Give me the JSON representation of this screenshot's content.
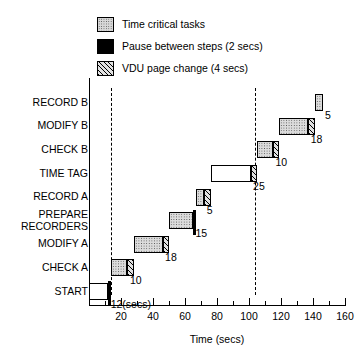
{
  "legend": {
    "items": [
      {
        "label": "Time critical tasks",
        "style": "dots"
      },
      {
        "label": "Pause between steps (2 secs)",
        "style": "black"
      },
      {
        "label": "VDU page change (4 secs)",
        "style": "hatch"
      }
    ]
  },
  "axes": {
    "x_title": "Time (secs)",
    "x_ticks": [
      20,
      40,
      60,
      80,
      100,
      120,
      140,
      160
    ],
    "x_minor_step": 10,
    "x_range": [
      0,
      160
    ],
    "y_categories": [
      "START",
      "CHECK A",
      "MODIFY A",
      "PREPARE RECORDERS",
      "RECORD A",
      "TIME TAG",
      "CHECK B",
      "MODIFY B",
      "RECORD B"
    ],
    "y_labels": [
      {
        "text": "RECORD B",
        "row": 9
      },
      {
        "text": "MODIFY B",
        "row": 8
      },
      {
        "text": "CHECK B",
        "row": 7
      },
      {
        "text": "TIME TAG",
        "row": 6
      },
      {
        "text": "RECORD A",
        "row": 5
      },
      {
        "text": "PREPARE\nRECORDERS",
        "row": 4
      },
      {
        "text": "MODIFY A",
        "row": 3
      },
      {
        "text": "CHECK A",
        "row": 2
      },
      {
        "text": "START",
        "row": 1
      }
    ],
    "reference_lines": [
      14,
      104
    ]
  },
  "chart_data": {
    "type": "bar",
    "title": "",
    "xlabel": "Time (secs)",
    "ylabel": "",
    "xlim": [
      0,
      160
    ],
    "grid": false,
    "legend_position": "top",
    "orientation": "horizontal-staircase",
    "categories": [
      "START",
      "CHECK A",
      "MODIFY A",
      "PREPARE RECORDERS",
      "RECORD A",
      "TIME TAG",
      "CHECK B",
      "MODIFY B",
      "RECORD B"
    ],
    "durations": [
      12,
      10,
      18,
      15,
      5,
      25,
      10,
      18,
      5
    ],
    "value_labels": [
      "12(secs)",
      "10",
      "18",
      "15",
      "5",
      "25",
      "10",
      "18",
      "5"
    ],
    "segments": [
      {
        "task": "START",
        "row": 1,
        "start": 0,
        "end": 12,
        "duration": 12,
        "kind": "plain",
        "label": "12(secs)"
      },
      {
        "task": "PAUSE 1",
        "row": 1,
        "start": 12,
        "end": 14,
        "duration": 2,
        "kind": "pause",
        "label": ""
      },
      {
        "task": "CHECK A",
        "row": 2,
        "start": 14,
        "end": 24,
        "duration": 10,
        "kind": "task",
        "label": "10"
      },
      {
        "task": "VDU 1",
        "row": 2,
        "start": 24,
        "end": 28,
        "duration": 4,
        "kind": "vdu",
        "label": ""
      },
      {
        "task": "MODIFY A",
        "row": 3,
        "start": 28,
        "end": 46,
        "duration": 18,
        "kind": "task",
        "label": "18"
      },
      {
        "task": "VDU 2",
        "row": 3,
        "start": 46,
        "end": 50,
        "duration": 4,
        "kind": "vdu",
        "label": ""
      },
      {
        "task": "PREPARE RECORDERS",
        "row": 4,
        "start": 50,
        "end": 65,
        "duration": 15,
        "kind": "task",
        "label": "15"
      },
      {
        "task": "PAUSE 2",
        "row": 4,
        "start": 65,
        "end": 67,
        "duration": 2,
        "kind": "pause",
        "label": ""
      },
      {
        "task": "RECORD A",
        "row": 5,
        "start": 67,
        "end": 72,
        "duration": 5,
        "kind": "task",
        "label": "5"
      },
      {
        "task": "VDU 3",
        "row": 5,
        "start": 72,
        "end": 76,
        "duration": 4,
        "kind": "vdu",
        "label": ""
      },
      {
        "task": "TIME TAG",
        "row": 6,
        "start": 76,
        "end": 101,
        "duration": 25,
        "kind": "plain",
        "label": "25"
      },
      {
        "task": "VDU 4",
        "row": 6,
        "start": 101,
        "end": 105,
        "duration": 4,
        "kind": "vdu",
        "label": ""
      },
      {
        "task": "CHECK B",
        "row": 7,
        "start": 105,
        "end": 115,
        "duration": 10,
        "kind": "task",
        "label": "10"
      },
      {
        "task": "VDU 5",
        "row": 7,
        "start": 115,
        "end": 119,
        "duration": 4,
        "kind": "vdu",
        "label": ""
      },
      {
        "task": "MODIFY B",
        "row": 8,
        "start": 119,
        "end": 137,
        "duration": 18,
        "kind": "task",
        "label": "18"
      },
      {
        "task": "VDU 6",
        "row": 8,
        "start": 137,
        "end": 141,
        "duration": 4,
        "kind": "vdu",
        "label": ""
      },
      {
        "task": "RECORD B",
        "row": 9,
        "start": 141,
        "end": 146,
        "duration": 5,
        "kind": "task",
        "label": "5"
      }
    ]
  }
}
